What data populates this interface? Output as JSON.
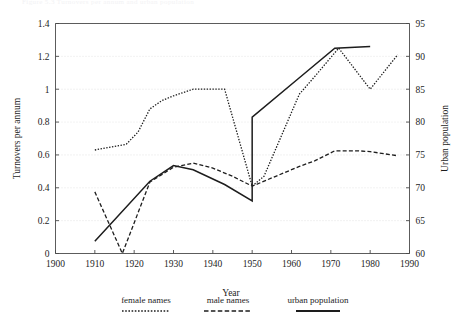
{
  "figure": {
    "ghost_text": "Figure 5.3  Turnovers per annum and urban population",
    "background_color": "#ffffff",
    "line_color": "#1d1d1d",
    "grid_color": "#d8d8d8"
  },
  "chart_data": {
    "type": "line",
    "title": "",
    "xlabel": "Year",
    "ylabel": "Turnovers per annum",
    "y2label": "Urban population",
    "xlim": [
      1900,
      1990
    ],
    "ylim": [
      0,
      1.4
    ],
    "y2lim": [
      60,
      95
    ],
    "xticks": [
      1900,
      1910,
      1920,
      1930,
      1940,
      1950,
      1960,
      1970,
      1980,
      1990
    ],
    "yticks": [
      0,
      0.2,
      0.4,
      0.6,
      0.8,
      1,
      1.2,
      1.4
    ],
    "y2ticks": [
      60,
      65,
      70,
      75,
      80,
      85,
      90,
      95
    ],
    "xtick_labels": [
      "1900",
      "1910",
      "1920",
      "1930",
      "1940",
      "1950",
      "1960",
      "1970",
      "1980",
      "1990"
    ],
    "ytick_labels": [
      "0",
      "0.2",
      "0.4",
      "0.6",
      "0.8",
      "1",
      "1.2",
      "1.4"
    ],
    "y2tick_labels": [
      "60",
      "65",
      "70",
      "75",
      "80",
      "85",
      "90",
      "95"
    ],
    "grid": "horizontal-dotted",
    "legend_position": "below-bottom-center",
    "series": [
      {
        "name": "female names",
        "style": "dotted",
        "axis": "left",
        "x": [
          1910,
          1918,
          1921,
          1924,
          1927,
          1930,
          1935,
          1943,
          1950,
          1953,
          1962,
          1966,
          1972,
          1980,
          1987
        ],
        "values": [
          0.63,
          0.665,
          0.74,
          0.88,
          0.93,
          0.96,
          1.0,
          1.0,
          0.41,
          0.47,
          0.97,
          1.08,
          1.25,
          1.0,
          1.21
        ]
      },
      {
        "name": "male names",
        "style": "dashed",
        "axis": "left",
        "x": [
          1910,
          1917,
          1924,
          1930,
          1935,
          1940,
          1945,
          1950,
          1956,
          1962,
          1966,
          1971,
          1977,
          1980,
          1987
        ],
        "values": [
          0.375,
          0.0,
          0.435,
          0.525,
          0.55,
          0.52,
          0.47,
          0.41,
          0.47,
          0.53,
          0.565,
          0.625,
          0.625,
          0.62,
          0.595
        ]
      },
      {
        "name": "urban population",
        "style": "solid",
        "axis": "right",
        "x": [
          1910,
          1924,
          1930,
          1935,
          1943,
          1950,
          1950,
          1962,
          1971,
          1980
        ],
        "values": [
          0.075,
          0.44,
          0.535,
          0.51,
          0.42,
          0.32,
          0.83,
          1.07,
          1.25,
          1.26
        ],
        "note": "vertical discontinuity at 1950"
      }
    ],
    "legend": [
      {
        "label": "female names",
        "style": "dotted"
      },
      {
        "label": "male names",
        "style": "dashed"
      },
      {
        "label": "urban population",
        "style": "solid"
      }
    ]
  }
}
